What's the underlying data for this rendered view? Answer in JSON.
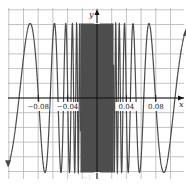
{
  "chart_data": {
    "type": "line",
    "title": "",
    "function": "y = sin(1/x)",
    "xlabel": "x",
    "ylabel": "y",
    "xlim": [
      -0.12,
      0.12
    ],
    "ylim": [
      -1.15,
      1.15
    ],
    "grid": true,
    "legend": null,
    "x_ticks": [
      {
        "value": -0.08,
        "label": "−0.08"
      },
      {
        "value": -0.04,
        "label": "−0.04"
      },
      {
        "value": 0.04,
        "label": "0.04"
      },
      {
        "value": 0.08,
        "label": "0.08"
      }
    ],
    "y_ticks": [
      {
        "value": 1,
        "label": "1"
      },
      {
        "value": -1,
        "label": "−1"
      }
    ],
    "series": [
      {
        "name": "sin(1/x)",
        "color": "#555555",
        "arrows_at_ends": true,
        "note": "oscillates between -1 and 1 with increasing frequency as x approaches 0; dense dark band near origin"
      }
    ],
    "colors": {
      "grid": "#b5b5b5",
      "axis": "#111111",
      "curve": "#4a4a4a",
      "dense_band": "#4d4d4d",
      "background": "#ffffff"
    }
  }
}
